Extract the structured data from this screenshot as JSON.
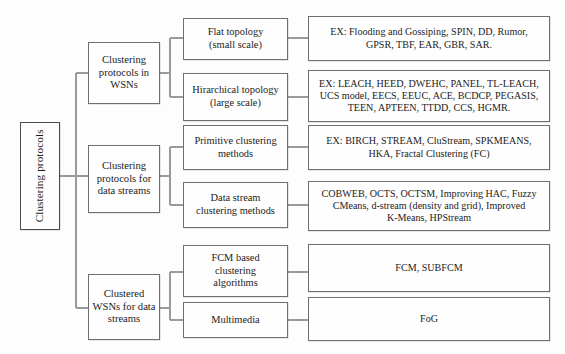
{
  "diagram": {
    "style": {
      "box_border_color": "#6f6f6f",
      "box_fill_color": "#fefefe",
      "connector_color": "#9a9a9a",
      "text_color": "#1c1c1c",
      "background": "#fdfdfd"
    },
    "root": {
      "id": "root",
      "label": "Clustering protocols",
      "orientation": "vertical-text"
    },
    "level1": [
      {
        "id": "l1-wsn",
        "label": "Clustering\nprotocols in\nWSNs"
      },
      {
        "id": "l1-streams",
        "label": "Clustering\nprotocols for\ndata streams"
      },
      {
        "id": "l1-clustered",
        "label": "Clustered\nWSNs for data\nstreams"
      }
    ],
    "level2": [
      {
        "id": "l2-flat",
        "label": "Flat topology\n(small scale)",
        "parent": "l1-wsn"
      },
      {
        "id": "l2-hier",
        "label": "Hirarchical topology\n(large scale)",
        "parent": "l1-wsn"
      },
      {
        "id": "l2-primitive",
        "label": "Primitive clustering\nmethods",
        "parent": "l1-streams"
      },
      {
        "id": "l2-datastream",
        "label": "Data stream\nclustering methods",
        "parent": "l1-streams"
      },
      {
        "id": "l2-fcm",
        "label": "FCM based\nclustering\nalgorithms",
        "parent": "l1-clustered"
      },
      {
        "id": "l2-multimedia",
        "label": "Multimedia",
        "parent": "l1-clustered"
      }
    ],
    "leaves": [
      {
        "id": "leaf-flat",
        "label": "EX: Flooding and Gossiping, SPIN, DD, Rumor,\nGPSR, TBF, EAR, GBR, SAR.",
        "parent": "l2-flat"
      },
      {
        "id": "leaf-hier",
        "label": "EX: LEACH, HEED, DWEHC, PANEL, TL-LEACH,\nUCS model, EECS, EEUC, ACE, BCDCP, PEGASIS,\nTEEN, APTEEN, TTDD, CCS, HGMR.",
        "parent": "l2-hier"
      },
      {
        "id": "leaf-primitive",
        "label": "EX: BIRCH, STREAM, CluStream, SPKMEANS,\nHKA, Fractal Clustering (FC)",
        "parent": "l2-primitive"
      },
      {
        "id": "leaf-datastream",
        "label": "COBWEB, OCTS, OCTSM, Improving HAC, Fuzzy\nCMeans, d-stream (density and grid), Improved\nK-Means, HPStream",
        "parent": "l2-datastream"
      },
      {
        "id": "leaf-fcm",
        "label": "FCM, SUBFCM",
        "parent": "l2-fcm"
      },
      {
        "id": "leaf-multimedia",
        "label": "FoG",
        "parent": "l2-multimedia"
      }
    ]
  }
}
